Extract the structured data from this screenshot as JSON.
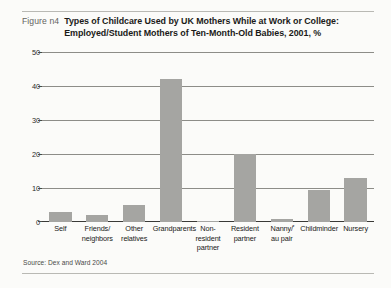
{
  "figure": {
    "label": "Figure n4",
    "title_line1": "Types of Childcare Used by UK Mothers While at Work or College:",
    "title_line2": "Employed/Student Mothers of Ten-Month-Old Babies, 2001, %",
    "source": "Source: Dex and Ward 2004",
    "footnote_marker": "*"
  },
  "chart_data": {
    "type": "bar",
    "title": "Types of Childcare Used by UK Mothers While at Work or College: Employed/Student Mothers of Ten-Month-Old Babies, 2001, %",
    "xlabel": "",
    "ylabel": "",
    "ylim": [
      0,
      50
    ],
    "yticks": [
      0,
      10,
      20,
      30,
      40,
      50
    ],
    "ytick_labels": [
      "0",
      "10",
      "20",
      "30",
      "40",
      "50"
    ],
    "grid": true,
    "legend": false,
    "categories": [
      "Self",
      "Friends/ neighbors",
      "Other relatives",
      "Grandparents",
      "Non-resident partner",
      "Resident partner",
      "Nanny/ au pair",
      "Childminder",
      "Nursery"
    ],
    "category_lines": [
      [
        "Self"
      ],
      [
        "Friends/",
        "neighbors"
      ],
      [
        "Other",
        "relatives"
      ],
      [
        "Grandparents"
      ],
      [
        "Non-resident",
        "partner"
      ],
      [
        "Resident",
        "partner"
      ],
      [
        "Nanny/",
        "au pair"
      ],
      [
        "Childminder"
      ],
      [
        "Nursery"
      ]
    ],
    "values": [
      3,
      2,
      5,
      42,
      0.4,
      20,
      1,
      9.5,
      13
    ],
    "bar_color": "#a5a5a2",
    "background_color": "#fbfbf9"
  }
}
